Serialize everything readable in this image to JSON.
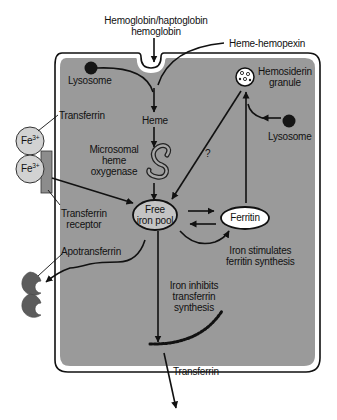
{
  "colors": {
    "cell_fill": "#9a9a9a",
    "cell_border": "#111111",
    "background": "#ffffff",
    "transferrin_fill": "#d2d2d2",
    "apotransferrin_fill": "#5c5c5c",
    "free_iron_pool_fill": "#c4c4c4",
    "ferritin_fill": "#ffffff",
    "lysosome_fill": "#151515"
  },
  "labels": {
    "hemoglobin_line1": "Hemoglobin/haptoglobin",
    "hemoglobin_line2": "hemoglobin",
    "heme_hemopexin": "Heme-hemopexin",
    "lysosome_left": "Lysosome",
    "lysosome_right": "Lysosome",
    "hemosiderin_line1": "Hemosiderin",
    "hemosiderin_line2": "granule",
    "transferrin_top": "Transferrin",
    "fe_ion": "Fe",
    "fe_charge": "3+",
    "heme": "Heme",
    "oxygenase_line1": "Microsomal",
    "oxygenase_line2": "heme",
    "oxygenase_line3": "oxygenase",
    "question_mark": "?",
    "transferrin_receptor_line1": "Transferrin",
    "transferrin_receptor_line2": "receptor",
    "free_iron_line1": "Free",
    "free_iron_line2": "iron pool",
    "ferritin": "Ferritin",
    "stimulates_line1": "Iron stimulates",
    "stimulates_line2": "ferritin synthesis",
    "apotransferrin": "Apotransferrin",
    "inhibits_line1": "Iron inhibits",
    "inhibits_line2": "transferrin",
    "inhibits_line3": "synthesis",
    "transferrin_out": "Transferrin"
  }
}
